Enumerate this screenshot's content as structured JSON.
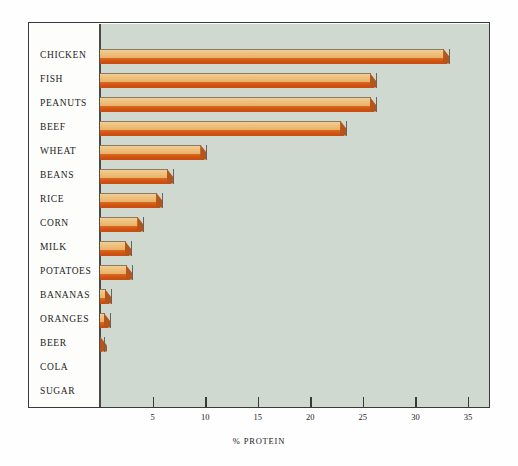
{
  "chart_data": {
    "type": "bar",
    "orientation": "horizontal",
    "title": "",
    "xlabel": "% PROTEIN",
    "ylabel": "",
    "xlim": [
      0,
      37
    ],
    "xticks": [
      5,
      10,
      15,
      20,
      25,
      30,
      35
    ],
    "grid": false,
    "legend": null,
    "categories": [
      "CHICKEN",
      "FISH",
      "PEANUTS",
      "BEEF",
      "WHEAT",
      "BEANS",
      "RICE",
      "CORN",
      "MILK",
      "POTATOES",
      "BANANAS",
      "ORANGES",
      "BEER",
      "COLA",
      "SUGAR"
    ],
    "values": [
      33.3,
      26.3,
      26.3,
      23.5,
      10.2,
      7.0,
      6.0,
      4.2,
      3.0,
      3.1,
      1.1,
      1.0,
      0.5,
      0.0,
      0.0
    ]
  },
  "colors": {
    "panel_background": "#cfd9d0",
    "page_background": "#fefefe",
    "bar_top_face": "#eec07c",
    "bar_front_face": "#d4571b",
    "bar_outline": "#6b625a",
    "axis": "#3a3a3a",
    "text": "#1c1c1c"
  }
}
